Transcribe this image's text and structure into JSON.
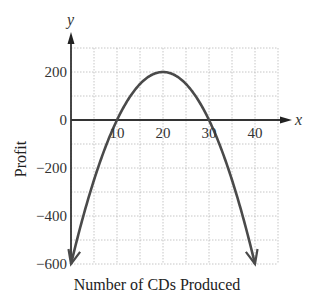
{
  "chart_data": {
    "type": "line",
    "title": "",
    "xlabel": "Number of CDs Produced",
    "ylabel": "Profit",
    "x_axis_letter": "x",
    "y_axis_letter": "y",
    "xlim": [
      0,
      45
    ],
    "ylim": [
      -600,
      300
    ],
    "x_ticks": [
      10,
      20,
      30,
      40
    ],
    "y_ticks": [
      200,
      0,
      -200,
      -400,
      -600
    ],
    "x_tick_labels": [
      "10",
      "20",
      "30",
      "40"
    ],
    "y_tick_labels": [
      "200",
      "0",
      "−200",
      "−400",
      "−600"
    ],
    "grid": true,
    "grid_x_step": 5,
    "grid_y_step": 100,
    "series": [
      {
        "name": "Profit",
        "equation": "y = -2x^2 + 80x - 600",
        "x": [
          0,
          5,
          10,
          15,
          20,
          25,
          30,
          35,
          40
        ],
        "values": [
          -600,
          -250,
          0,
          150,
          200,
          150,
          0,
          -250,
          -600
        ],
        "color": "#4a4a4a",
        "arrows_at_ends": true
      }
    ],
    "key_points": {
      "vertex": [
        20,
        200
      ],
      "x_intercepts": [
        10,
        30
      ],
      "endpoints": [
        [
          0,
          -600
        ],
        [
          40,
          -600
        ]
      ]
    }
  }
}
